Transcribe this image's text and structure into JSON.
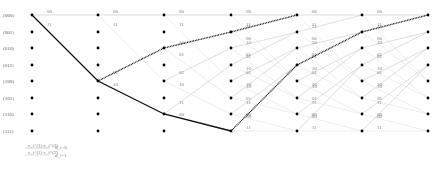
{
  "diagram": {
    "type": "trellis",
    "states": [
      "(000)",
      "(001)",
      "(010)",
      "(011)",
      "(100)",
      "(101)",
      "(110)",
      "(111)"
    ],
    "num_columns": 7,
    "column_x": [
      32,
      98,
      164,
      231,
      297,
      362,
      428
    ],
    "row_y": [
      15,
      32,
      48,
      65,
      81,
      98,
      114,
      131
    ],
    "output_labels": {
      "000": [
        "00",
        "11"
      ],
      "001": [
        "11",
        "00"
      ],
      "010": [
        "10",
        "01"
      ],
      "011": [
        "01",
        "10"
      ],
      "100": [
        "01",
        "10"
      ],
      "101": [
        "10",
        "01"
      ],
      "110": [
        "11",
        "00"
      ],
      "111": [
        "00",
        "11"
      ]
    },
    "stage_edges": [
      [
        [
          0,
          0,
          0
        ],
        [
          0,
          4,
          1
        ]
      ],
      [
        [
          0,
          0,
          0
        ],
        [
          0,
          4,
          1
        ],
        [
          4,
          2,
          0
        ],
        [
          4,
          6,
          1
        ]
      ],
      [
        [
          0,
          0,
          0
        ],
        [
          0,
          4,
          1
        ],
        [
          2,
          1,
          0
        ],
        [
          2,
          5,
          1
        ],
        [
          4,
          2,
          0
        ],
        [
          4,
          6,
          1
        ],
        [
          6,
          3,
          0
        ],
        [
          6,
          7,
          1
        ]
      ],
      [
        [
          0,
          0,
          0
        ],
        [
          0,
          4,
          1
        ],
        [
          1,
          0,
          0
        ],
        [
          1,
          4,
          1
        ],
        [
          2,
          1,
          0
        ],
        [
          2,
          5,
          1
        ],
        [
          3,
          1,
          0
        ],
        [
          3,
          5,
          1
        ],
        [
          4,
          2,
          0
        ],
        [
          4,
          6,
          1
        ],
        [
          5,
          2,
          0
        ],
        [
          5,
          6,
          1
        ],
        [
          6,
          3,
          0
        ],
        [
          6,
          7,
          1
        ],
        [
          7,
          3,
          0
        ],
        [
          7,
          7,
          1
        ]
      ],
      [
        [
          0,
          0,
          0
        ],
        [
          0,
          4,
          1
        ],
        [
          1,
          0,
          0
        ],
        [
          1,
          4,
          1
        ],
        [
          2,
          1,
          0
        ],
        [
          2,
          5,
          1
        ],
        [
          3,
          1,
          0
        ],
        [
          3,
          5,
          1
        ],
        [
          4,
          2,
          0
        ],
        [
          4,
          6,
          1
        ],
        [
          5,
          2,
          0
        ],
        [
          5,
          6,
          1
        ],
        [
          6,
          3,
          0
        ],
        [
          6,
          7,
          1
        ],
        [
          7,
          3,
          0
        ],
        [
          7,
          7,
          1
        ]
      ],
      [
        [
          0,
          0,
          0
        ],
        [
          0,
          4,
          1
        ],
        [
          1,
          0,
          0
        ],
        [
          1,
          4,
          1
        ],
        [
          2,
          1,
          0
        ],
        [
          2,
          5,
          1
        ],
        [
          3,
          1,
          0
        ],
        [
          3,
          5,
          1
        ],
        [
          4,
          2,
          0
        ],
        [
          4,
          6,
          1
        ],
        [
          5,
          2,
          0
        ],
        [
          5,
          6,
          1
        ],
        [
          6,
          3,
          0
        ],
        [
          6,
          7,
          1
        ],
        [
          7,
          3,
          0
        ],
        [
          7,
          7,
          1
        ]
      ]
    ],
    "bold_path": {
      "style": "solid",
      "nodes": [
        [
          0,
          0
        ],
        [
          1,
          4
        ],
        [
          2,
          6
        ],
        [
          3,
          7
        ]
      ]
    },
    "dotted_paths": [
      {
        "style": "dotted",
        "nodes": [
          [
            1,
            4
          ],
          [
            2,
            2
          ],
          [
            3,
            1
          ],
          [
            4,
            0
          ]
        ]
      },
      {
        "style": "dotted",
        "nodes": [
          [
            3,
            7
          ],
          [
            4,
            3
          ],
          [
            5,
            1
          ],
          [
            6,
            0
          ]
        ]
      }
    ],
    "colors": {
      "edge_d0": "#c8c8c8",
      "edge_d1": "#e2e2e2",
      "path": "#111111",
      "node": "#000000"
    }
  },
  "legend": {
    "items": [
      {
        "symbol": "c_i^(1) c_i^(2)",
        "label": "d_i=0"
      },
      {
        "symbol": "c_i^(1) c_i^(2)",
        "label": "d_i=1"
      }
    ]
  }
}
